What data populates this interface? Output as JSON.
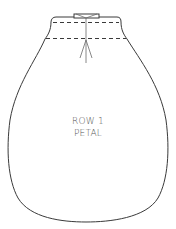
{
  "diagram": {
    "label_lines": [
      "ROW 1",
      "PETAL"
    ],
    "colors": {
      "outline": "#3a3a3a",
      "text": "#555555",
      "background": "#ffffff"
    },
    "elements": {
      "outline": "petal-outline",
      "fold_lines": [
        "upper-dashed-line",
        "lower-dashed-line"
      ],
      "center_line": "vertical-center-line",
      "gather_marks": "fan-lines",
      "tab": "top-tab"
    }
  }
}
